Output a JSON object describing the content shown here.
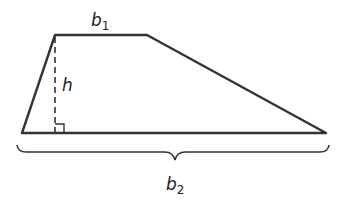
{
  "diagram": {
    "shape": "trapezoid",
    "labels": {
      "top_base": {
        "var": "b",
        "sub": "1"
      },
      "height": {
        "var": "h"
      },
      "bottom_base": {
        "var": "b",
        "sub": "2"
      }
    },
    "colors": {
      "stroke": "#333333",
      "background": "#ffffff"
    }
  }
}
